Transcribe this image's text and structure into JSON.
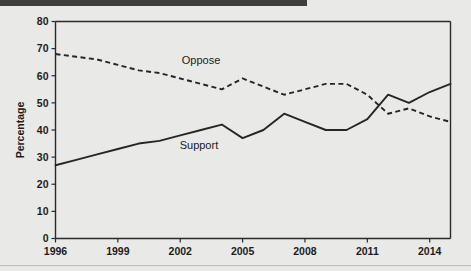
{
  "page": {
    "background_color": "#e9e9e7",
    "top_bar_color": "#3f3f3f",
    "line_color": "#262626"
  },
  "chart_data": {
    "type": "line",
    "title": "",
    "subtitle": "",
    "xlabel": "",
    "ylabel": "Percentage",
    "xlim": [
      1996,
      2015
    ],
    "ylim": [
      0,
      80
    ],
    "grid": false,
    "legend_position": "inline-annotations",
    "y_ticks": [
      0,
      10,
      20,
      30,
      40,
      50,
      60,
      70,
      80
    ],
    "y_tick_labels": [
      "0",
      "10",
      "20",
      "30",
      "40",
      "50",
      "60",
      "70",
      "80"
    ],
    "x_ticks": [
      1996,
      1999,
      2002,
      2005,
      2008,
      2011,
      2014
    ],
    "x_tick_labels": [
      "1996",
      "1999",
      "2002",
      "2005",
      "2008",
      "2011",
      "2014"
    ],
    "annotations": [
      {
        "text": "Oppose",
        "x": 2003.0,
        "y": 64.5
      },
      {
        "text": "Support",
        "x": 2002.9,
        "y": 33.0
      }
    ],
    "series": [
      {
        "name": "Support",
        "style": "solid",
        "x": [
          1996,
          1997,
          1998,
          1999,
          2000,
          2001,
          2002,
          2003,
          2004,
          2005,
          2006,
          2007,
          2008,
          2009,
          2010,
          2011,
          2012,
          2013,
          2014,
          2015
        ],
        "values": [
          27,
          29,
          31,
          33,
          35,
          36,
          38,
          40,
          42,
          37,
          40,
          46,
          43,
          40,
          40,
          44,
          53,
          50,
          54,
          57
        ]
      },
      {
        "name": "Oppose",
        "style": "dashed",
        "x": [
          1996,
          1997,
          1998,
          1999,
          2000,
          2001,
          2002,
          2003,
          2004,
          2005,
          2006,
          2007,
          2008,
          2009,
          2010,
          2011,
          2012,
          2013,
          2014,
          2015
        ],
        "values": [
          68,
          67,
          66,
          64,
          62,
          61,
          59,
          57,
          55,
          59,
          56,
          53,
          55,
          57,
          57,
          53,
          46,
          48,
          45,
          43
        ]
      }
    ]
  }
}
